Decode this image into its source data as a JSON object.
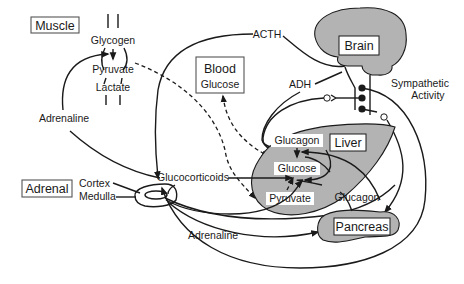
{
  "diagram": {
    "organs": {
      "muscle": {
        "label": "Muscle",
        "metabolites": [
          "Glycogen",
          "Pyruvate",
          "Lactate"
        ]
      },
      "blood": {
        "label": "Blood",
        "content": "Glucose"
      },
      "brain": {
        "label": "Brain"
      },
      "liver": {
        "label": "Liver",
        "metabolites": [
          "Glucagon",
          "Glucose",
          "Pyruvate"
        ]
      },
      "adrenal": {
        "label": "Adrenal",
        "parts": [
          "Cortex",
          "Medulla"
        ]
      },
      "pancreas": {
        "label": "Pancreas"
      }
    },
    "signals": {
      "acth": "ACTH",
      "adh": "ADH",
      "sympathetic": [
        "Sympathetic",
        "Activity"
      ],
      "adrenaline_muscle": "Adrenaline",
      "adrenaline_pancreas": "Adrenaline",
      "glucocorticoids": "Glucocorticoids",
      "glucagon_pancreas": "Glucagon"
    },
    "colors": {
      "organ_fill": "#b3b3b3",
      "stroke": "#1a1a1a",
      "background": "#ffffff"
    }
  }
}
